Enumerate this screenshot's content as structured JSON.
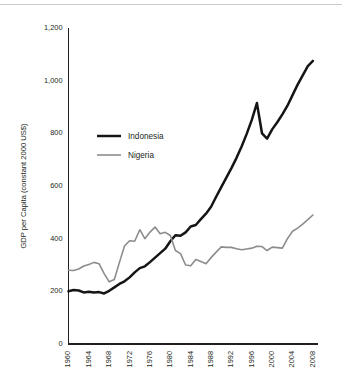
{
  "figure": {
    "background_color": "#ffffff",
    "rule_color": "#c9cbcd",
    "axis_color": "#231f20"
  },
  "chart_data": {
    "type": "line",
    "title": "",
    "subtitle": "",
    "xlabel": "",
    "ylabel": "GDP per Capita (constant 2000 US$)",
    "xlim": [
      1960,
      2009
    ],
    "ylim": [
      0,
      1200
    ],
    "yticks": [
      0,
      200,
      400,
      600,
      800,
      1000,
      1200
    ],
    "ytick_labels": [
      "0",
      "200",
      "400",
      "600",
      "800",
      "1,000",
      "1,200"
    ],
    "xticks": [
      1960,
      1964,
      1968,
      1972,
      1976,
      1980,
      1984,
      1988,
      1992,
      1996,
      2000,
      2004,
      2008
    ],
    "xtick_labels": [
      "1960",
      "1964",
      "1968",
      "1972",
      "1976",
      "1980",
      "1984",
      "1988",
      "1992",
      "1996",
      "2000",
      "2004",
      "2008"
    ],
    "xtick_rotation": 90,
    "grid": false,
    "legend_position": "upper-left-inside",
    "x": [
      1960,
      1961,
      1962,
      1963,
      1964,
      1965,
      1966,
      1967,
      1968,
      1969,
      1970,
      1971,
      1972,
      1973,
      1974,
      1975,
      1976,
      1977,
      1978,
      1979,
      1980,
      1981,
      1982,
      1983,
      1984,
      1985,
      1986,
      1987,
      1988,
      1989,
      1990,
      1991,
      1992,
      1993,
      1994,
      1995,
      1996,
      1997,
      1998,
      1999,
      2000,
      2001,
      2002,
      2003,
      2004,
      2005,
      2006,
      2007,
      2008
    ],
    "series": [
      {
        "name": "Indonesia",
        "color": "#151515",
        "line_width": 2.5,
        "values": [
          200,
          205,
          203,
          196,
          198,
          196,
          197,
          192,
          202,
          215,
          228,
          238,
          253,
          272,
          288,
          295,
          311,
          328,
          345,
          362,
          390,
          413,
          411,
          424,
          446,
          452,
          474,
          495,
          521,
          559,
          596,
          632,
          668,
          707,
          750,
          798,
          851,
          915,
          800,
          780,
          815,
          842,
          872,
          905,
          945,
          985,
          1020,
          1055,
          1075
        ]
      },
      {
        "name": "Nigeria",
        "color": "#8c8c8c",
        "line_width": 1.6,
        "values": [
          280,
          279,
          285,
          296,
          302,
          310,
          305,
          267,
          236,
          245,
          310,
          372,
          392,
          390,
          434,
          400,
          425,
          444,
          419,
          424,
          412,
          355,
          343,
          300,
          297,
          321,
          313,
          305,
          328,
          349,
          369,
          367,
          367,
          362,
          358,
          361,
          364,
          371,
          370,
          355,
          368,
          366,
          364,
          400,
          428,
          440,
          455,
          472,
          490
        ]
      }
    ]
  },
  "legend": {
    "items": [
      {
        "label": "Indonesia",
        "color": "#151515",
        "line_width": 2.5
      },
      {
        "label": "Nigeria",
        "color": "#8c8c8c",
        "line_width": 1.6
      }
    ]
  }
}
